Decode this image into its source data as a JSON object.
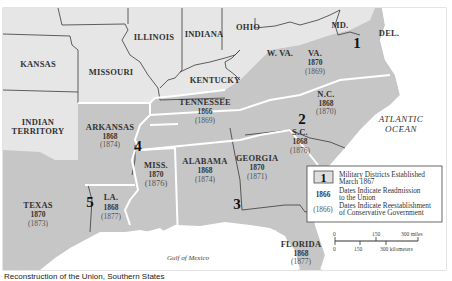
{
  "map": {
    "colors": {
      "union": "#e6e6e6",
      "confederate": "#c6c6c6",
      "water": "#ffffff",
      "border_state": "#3a3a3a",
      "border_district": "#ffffff"
    },
    "union_states": [
      "KANSAS",
      "MISSOURI",
      "ILLINOIS",
      "INDIANA",
      "OHIO",
      "W. VA.",
      "KENTUCKY",
      "MD.",
      "DEL.",
      "INDIAN TERRITORY"
    ],
    "states": {
      "va": {
        "name": "VA.",
        "readmission": "1870",
        "conservative": "(1869)"
      },
      "nc": {
        "name": "N.C.",
        "readmission": "1868",
        "conservative": "(1870)"
      },
      "sc": {
        "name": "S.C.",
        "readmission": "1868",
        "conservative": "(1876)"
      },
      "ga": {
        "name": "GEORGIA",
        "readmission": "1870",
        "conservative": "(1871)"
      },
      "fl": {
        "name": "FLORIDA",
        "readmission": "1868",
        "conservative": "(1877)"
      },
      "al": {
        "name": "ALABAMA",
        "readmission": "1868",
        "conservative": "(1874)"
      },
      "ms": {
        "name": "MISS.",
        "readmission": "1870",
        "conservative": "(1876)"
      },
      "la": {
        "name": "LA.",
        "readmission": "1868",
        "conservative": "(1877)"
      },
      "tx": {
        "name": "TEXAS",
        "readmission": "1870",
        "conservative": "(1873)"
      },
      "ar": {
        "name": "ARKANSAS",
        "readmission": "1868",
        "conservative": "(1874)"
      },
      "tn": {
        "name": "TENNESSEE",
        "readmission": "1866",
        "conservative": "(1869)"
      }
    },
    "other_labels": {
      "kansas": "KANSAS",
      "missouri": "MISSOURI",
      "illinois": "ILLINOIS",
      "indiana": "INDIANA",
      "ohio": "OHIO",
      "wva": "W. VA.",
      "kentucky": "KENTUCKY",
      "md": "MD.",
      "del": "DEL.",
      "indian_territory_1": "INDIAN",
      "indian_territory_2": "TERRITORY"
    },
    "districts": [
      "1",
      "2",
      "3",
      "4",
      "5"
    ],
    "water": {
      "atlantic_1": "ATLANTIC",
      "atlantic_2": "OCEAN",
      "gulf": "Gulf of Mexico"
    }
  },
  "legend": {
    "district_sample": "1",
    "district_1": "Military Districts Established",
    "district_2": "March 1867",
    "readmit_sample": "1866",
    "readmit_1": "Dates Indicate Readmission",
    "readmit_2": "to the Union",
    "cons_sample": "(1866)",
    "cons_1": "Dates Indicate Reestablishment",
    "cons_2": "of Conservative Government"
  },
  "scale": {
    "miles": {
      "zero": "0",
      "mid": "150",
      "end": "300 miles"
    },
    "km": {
      "zero": "0",
      "mid": "150",
      "end": "300 kilometers"
    }
  },
  "caption": "Reconstruction of the Union, Southern States"
}
